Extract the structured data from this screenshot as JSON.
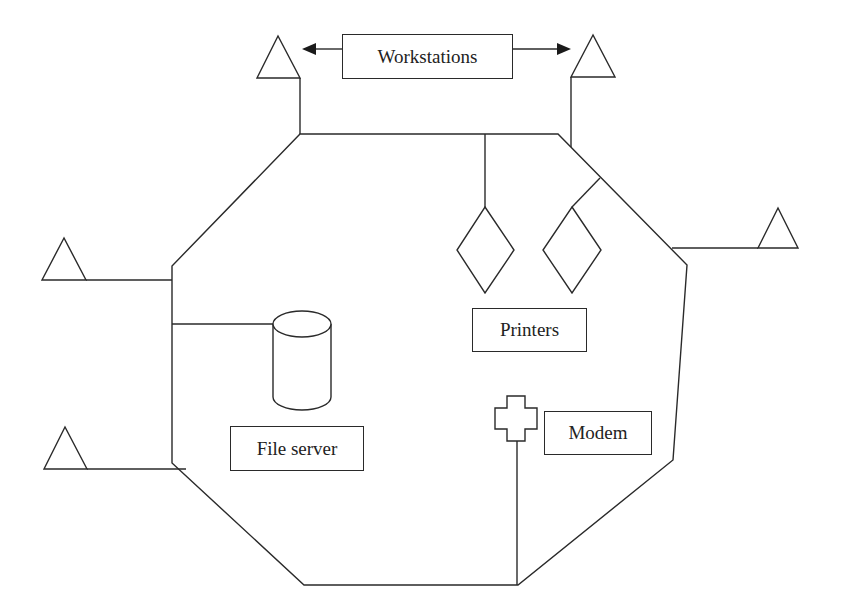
{
  "diagram": {
    "type": "network-topology",
    "labels": {
      "workstations": "Workstations",
      "printers": "Printers",
      "file_server": "File server",
      "modem": "Modem"
    },
    "nodes": [
      {
        "id": "ws-top-left",
        "kind": "workstation",
        "shape": "triangle"
      },
      {
        "id": "ws-top-right",
        "kind": "workstation",
        "shape": "triangle"
      },
      {
        "id": "ws-right",
        "kind": "workstation",
        "shape": "triangle"
      },
      {
        "id": "ws-left-upper",
        "kind": "workstation",
        "shape": "triangle"
      },
      {
        "id": "ws-left-lower",
        "kind": "workstation",
        "shape": "triangle"
      },
      {
        "id": "printer-1",
        "kind": "printer",
        "shape": "diamond"
      },
      {
        "id": "printer-2",
        "kind": "printer",
        "shape": "diamond"
      },
      {
        "id": "file-server",
        "kind": "file server",
        "shape": "cylinder"
      },
      {
        "id": "modem",
        "kind": "modem",
        "shape": "cross"
      }
    ],
    "backbone": {
      "shape": "octagon ring"
    },
    "colors": {
      "line": "#2a2a2a",
      "background": "#ffffff"
    }
  }
}
